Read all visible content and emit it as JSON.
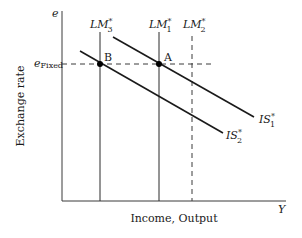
{
  "diagram": {
    "y_axis_symbol": "e",
    "x_axis_symbol": "Y",
    "y_axis_title": "Exchange rate",
    "x_axis_title": "Income, Output",
    "fixed_rate_label": {
      "main": "e",
      "sub": "Fixed"
    },
    "curves": {
      "LM3": {
        "main": "LM",
        "sup": "*",
        "sub": "3",
        "style": "solid"
      },
      "LM1": {
        "main": "LM",
        "sup": "*",
        "sub": "1",
        "style": "solid"
      },
      "LM2": {
        "main": "LM",
        "sup": "*",
        "sub": "2",
        "style": "dashed"
      },
      "IS1": {
        "main": "IS",
        "sup": "*",
        "sub": "1",
        "style": "solid"
      },
      "IS2": {
        "main": "IS",
        "sup": "*",
        "sub": "2",
        "style": "solid"
      }
    },
    "points": {
      "A": "A",
      "B": "B"
    }
  }
}
